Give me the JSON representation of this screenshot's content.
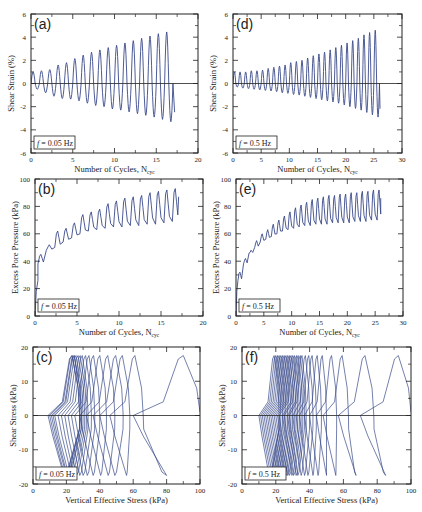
{
  "figure": {
    "line_color": "#3a4a8a",
    "frame_color": "#222222"
  },
  "chart_data": [
    {
      "id": "a",
      "panel_label": "(a)",
      "type": "line",
      "frequency_label": "f = 0.05 Hz",
      "xlabel": "Number of Cycles, N_cyc",
      "ylabel": "Shear Strain (%)",
      "xlim": [
        0,
        20
      ],
      "ylim": [
        -6,
        6
      ],
      "xticks": [
        0,
        5,
        10,
        15,
        20
      ],
      "yticks": [
        -6,
        -4,
        -2,
        0,
        2,
        4,
        6
      ],
      "zero_line": true,
      "series": [
        {
          "name": "Shear strain",
          "n_cycles": 17,
          "end_x": 17.2,
          "peaks_pos": [
            1.0,
            1.1,
            1.2,
            1.6,
            1.8,
            2.15,
            2.45,
            2.7,
            2.9,
            3.1,
            3.3,
            3.5,
            3.7,
            3.9,
            4.1,
            4.3,
            4.45
          ],
          "peaks_neg": [
            -0.5,
            -0.8,
            -1.1,
            -1.3,
            -1.35,
            -1.5,
            -1.7,
            -1.9,
            -2.0,
            -2.2,
            -2.3,
            -2.45,
            -2.6,
            -2.75,
            -2.9,
            -3.1,
            -3.3
          ]
        }
      ]
    },
    {
      "id": "d",
      "panel_label": "(d)",
      "type": "line",
      "frequency_label": "f = 0.5 Hz",
      "xlabel": "Number of Cycles, N_cyc",
      "ylabel": "Shear Strain (%)",
      "xlim": [
        0,
        30
      ],
      "ylim": [
        -6,
        6
      ],
      "xticks": [
        0,
        5,
        10,
        15,
        20,
        25,
        30
      ],
      "yticks": [
        -6,
        -4,
        -2,
        0,
        2,
        4,
        6
      ],
      "zero_line": true,
      "series": [
        {
          "name": "Shear strain",
          "n_cycles": 26,
          "end_x": 26.1,
          "peaks_pos": [
            1.0,
            1.0,
            1.0,
            1.1,
            1.1,
            1.15,
            1.3,
            1.4,
            1.5,
            1.6,
            1.8,
            1.9,
            2.0,
            2.2,
            2.4,
            2.55,
            2.7,
            2.9,
            3.1,
            3.3,
            3.5,
            3.7,
            3.9,
            4.2,
            4.4,
            4.6
          ],
          "peaks_neg": [
            -0.3,
            -0.4,
            -0.45,
            -0.5,
            -0.55,
            -0.6,
            -0.65,
            -0.7,
            -0.8,
            -0.85,
            -0.95,
            -1.0,
            -1.1,
            -1.2,
            -1.3,
            -1.4,
            -1.5,
            -1.6,
            -1.7,
            -1.85,
            -2.0,
            -2.15,
            -2.3,
            -2.5,
            -2.7,
            -2.9
          ]
        }
      ]
    },
    {
      "id": "b",
      "panel_label": "(b)",
      "type": "line",
      "frequency_label": "f = 0.05 Hz",
      "xlabel": "Number of Cycles, N_cyc",
      "ylabel": "Excess Pore Pressure (kPa)",
      "xlim": [
        0,
        20
      ],
      "ylim": [
        0,
        100
      ],
      "xticks": [
        0,
        5,
        10,
        15,
        20
      ],
      "yticks": [
        0,
        20,
        40,
        60,
        80,
        100
      ],
      "zero_line": false,
      "series": [
        {
          "name": "Excess pore pressure",
          "n_cycles": 17,
          "end_x": 17.1,
          "peaks_hi": [
            45,
            52,
            62,
            64,
            68,
            74,
            76,
            78,
            82,
            84,
            86,
            87,
            88,
            90,
            91,
            92,
            93
          ],
          "troughs_lo": [
            38,
            48,
            50,
            54,
            57,
            60,
            62,
            63,
            64,
            65,
            65,
            66,
            66,
            67,
            67,
            68,
            69
          ]
        }
      ]
    },
    {
      "id": "e",
      "panel_label": "(e)",
      "type": "line",
      "frequency_label": "f = 0.5 Hz",
      "xlabel": "Number of Cycles, N_cyc",
      "ylabel": "Excess Pore Pressure (kPa)",
      "xlim": [
        0,
        30
      ],
      "ylim": [
        0,
        100
      ],
      "xticks": [
        0,
        5,
        10,
        15,
        20,
        25,
        30
      ],
      "yticks": [
        0,
        20,
        40,
        60,
        80,
        100
      ],
      "zero_line": false,
      "series": [
        {
          "name": "Excess pore pressure",
          "n_cycles": 26,
          "end_x": 26.0,
          "peaks_hi": [
            32,
            42,
            48,
            55,
            60,
            63,
            67,
            70,
            73,
            76,
            79,
            81,
            83,
            85,
            86,
            87,
            88,
            88,
            89,
            89,
            90,
            90,
            91,
            91,
            92,
            92
          ],
          "troughs_lo": [
            26,
            38,
            46,
            50,
            54,
            56,
            58,
            60,
            62,
            63,
            64,
            65,
            66,
            66,
            67,
            67,
            67,
            68,
            68,
            68,
            68,
            69,
            69,
            69,
            70,
            70
          ]
        }
      ]
    },
    {
      "id": "c",
      "panel_label": "(c)",
      "type": "line",
      "frequency_label": "f = 0.05 Hz",
      "xlabel": "Vertical Effective Stress (kPa)",
      "ylabel": "Shear Stress (kPa)",
      "xlim": [
        0,
        100
      ],
      "ylim": [
        -20,
        20
      ],
      "xticks": [
        0,
        20,
        40,
        60,
        80,
        100
      ],
      "yticks": [
        -20,
        -10,
        0,
        10,
        20
      ],
      "zero_line": true,
      "series": [
        {
          "name": "Stress path",
          "n_cycles": 17,
          "start_sigma": 100,
          "tau_max": 17.5,
          "tau_min": -17.5,
          "cycle_right_sigma": [
            100,
            66,
            58,
            54,
            49,
            44,
            40,
            37,
            35,
            33,
            32,
            31,
            30,
            29,
            29,
            28,
            28
          ],
          "cycle_left_sigma": [
            60,
            46,
            40,
            36,
            32,
            28,
            25,
            23,
            21,
            19,
            17,
            15,
            13,
            12,
            11,
            10,
            9
          ]
        }
      ]
    },
    {
      "id": "f",
      "panel_label": "(f)",
      "type": "line",
      "frequency_label": "f = 0.5 Hz",
      "xlabel": "Vertical Effective Stress (kPa)",
      "ylabel": "Shear Stress (kPa)",
      "xlim": [
        0,
        100
      ],
      "ylim": [
        -20,
        20
      ],
      "xticks": [
        0,
        20,
        40,
        60,
        80,
        100
      ],
      "yticks": [
        -20,
        -10,
        0,
        10,
        20
      ],
      "zero_line": true,
      "series": [
        {
          "name": "Stress path",
          "n_cycles": 26,
          "start_sigma": 100,
          "tau_max": 17.5,
          "tau_min": -17.5,
          "cycle_right_sigma": [
            100,
            78,
            63,
            56,
            50,
            47,
            44,
            42,
            40,
            38,
            37,
            36,
            35,
            34,
            33,
            32,
            31,
            30,
            29,
            28,
            27,
            26,
            25,
            24,
            23,
            22
          ],
          "cycle_left_sigma": [
            70,
            57,
            48,
            44,
            40,
            37,
            34,
            32,
            30,
            28,
            27,
            25,
            24,
            22,
            21,
            20,
            19,
            18,
            17,
            16,
            15,
            14,
            13,
            12,
            11,
            10
          ]
        }
      ]
    }
  ],
  "layout": {
    "panels": {
      "a": {
        "left": 31,
        "top": 14,
        "right": 198,
        "bottom": 153
      },
      "d": {
        "left": 233,
        "top": 14,
        "right": 402,
        "bottom": 153
      },
      "b": {
        "left": 35,
        "top": 179,
        "right": 203,
        "bottom": 316
      },
      "e": {
        "left": 236,
        "top": 179,
        "right": 403,
        "bottom": 316
      },
      "c": {
        "left": 33,
        "top": 347,
        "right": 200,
        "bottom": 484
      },
      "f": {
        "left": 242,
        "top": 347,
        "right": 411,
        "bottom": 484
      }
    }
  }
}
